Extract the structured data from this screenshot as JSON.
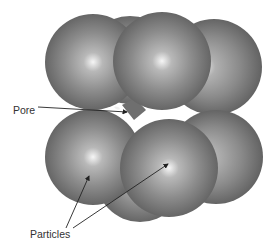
{
  "diagram": {
    "labels": {
      "pore": "Pore",
      "particles": "Particles"
    },
    "colors": {
      "sphere_highlight": "#f4f4f4",
      "sphere_mid": "#8a8a8a",
      "sphere_edge": "#5a5a5a",
      "pore_fill": "#6f6f6f",
      "arrow": "#222222",
      "label_text": "#333333",
      "background": "#ffffff"
    },
    "spheres": [
      {
        "id": "back-top-middle",
        "cx": 130,
        "cy": 58,
        "r": 45
      },
      {
        "id": "top-left",
        "cx": 93,
        "cy": 62,
        "r": 48
      },
      {
        "id": "top-right",
        "cx": 214,
        "cy": 67,
        "r": 48
      },
      {
        "id": "top-middle-front",
        "cx": 162,
        "cy": 62,
        "r": 49
      },
      {
        "id": "back-bottom-middle",
        "cx": 140,
        "cy": 175,
        "r": 45
      },
      {
        "id": "bottom-left",
        "cx": 93,
        "cy": 156,
        "r": 48
      },
      {
        "id": "bottom-right",
        "cx": 215,
        "cy": 156,
        "r": 47
      },
      {
        "id": "bottom-middle-front",
        "cx": 169,
        "cy": 167,
        "r": 49
      }
    ]
  }
}
